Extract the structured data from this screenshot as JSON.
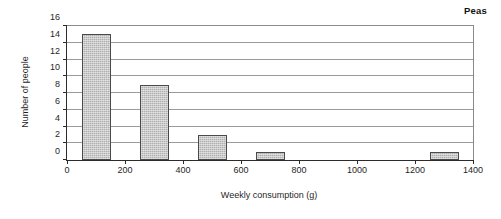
{
  "chart_data": {
    "type": "bar",
    "title": "Peas",
    "xlabel": "Weekly consumption (g)",
    "ylabel": "Number of people",
    "xlim": [
      0,
      1400
    ],
    "ylim": [
      0,
      16
    ],
    "xticks": [
      0,
      200,
      400,
      600,
      800,
      1000,
      1200,
      1400
    ],
    "yticks": [
      0,
      2,
      4,
      6,
      8,
      10,
      12,
      14,
      16
    ],
    "grid": "horizontal",
    "legend": "none",
    "bar_width": 100,
    "categories": [
      "100",
      "300",
      "500",
      "700",
      "1300"
    ],
    "x": [
      100,
      300,
      500,
      700,
      1300
    ],
    "values": [
      15,
      9,
      3,
      1,
      1
    ],
    "bin_edges": [
      [
        50,
        150
      ],
      [
        250,
        350
      ],
      [
        450,
        550
      ],
      [
        650,
        750
      ],
      [
        1250,
        1350
      ]
    ],
    "bar_fill_color": "#b0b0b0",
    "bar_border_color": "#4a4a4a",
    "axis_color": "#2b2b2b",
    "gridline_color": "#9b9b9b"
  }
}
